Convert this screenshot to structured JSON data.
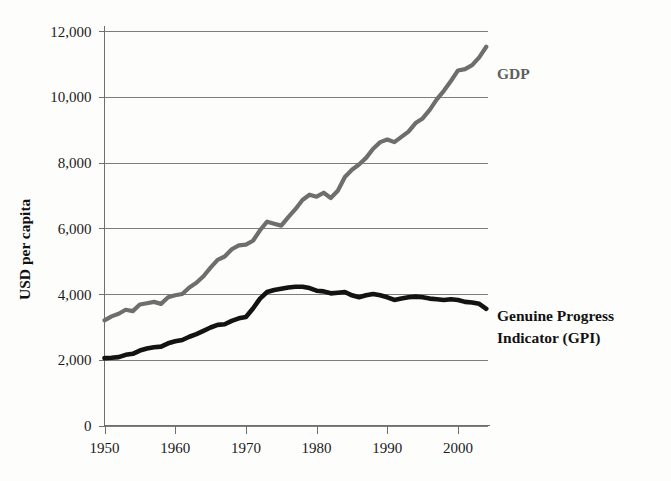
{
  "chart_data": {
    "type": "line",
    "title": "",
    "xlabel": "",
    "ylabel": "USD per capita",
    "xlim": [
      1950,
      2004
    ],
    "ylim": [
      0,
      12000
    ],
    "grid": true,
    "legend_position": "inline-right",
    "x_ticks": [
      "1950",
      "1960",
      "1970",
      "1980",
      "1990",
      "2000"
    ],
    "x_tick_values": [
      1950,
      1960,
      1970,
      1980,
      1990,
      2000
    ],
    "y_ticks": [
      "0",
      "2,000",
      "4,000",
      "6,000",
      "8,000",
      "10,000",
      "12,000"
    ],
    "y_tick_values": [
      0,
      2000,
      4000,
      6000,
      8000,
      10000,
      12000
    ],
    "x": [
      1950,
      1951,
      1952,
      1953,
      1954,
      1955,
      1956,
      1957,
      1958,
      1959,
      1960,
      1961,
      1962,
      1963,
      1964,
      1965,
      1966,
      1967,
      1968,
      1969,
      1970,
      1971,
      1972,
      1973,
      1974,
      1975,
      1976,
      1977,
      1978,
      1979,
      1980,
      1981,
      1982,
      1983,
      1984,
      1985,
      1986,
      1987,
      1988,
      1989,
      1990,
      1991,
      1992,
      1993,
      1994,
      1995,
      1996,
      1997,
      1998,
      1999,
      2000,
      2001,
      2002,
      2003,
      2004
    ],
    "series": [
      {
        "name": "GDP",
        "color": "#6e6e6e",
        "label": "GDP",
        "values": [
          3200,
          3320,
          3400,
          3520,
          3480,
          3680,
          3720,
          3760,
          3700,
          3900,
          3960,
          4000,
          4200,
          4340,
          4540,
          4800,
          5040,
          5140,
          5360,
          5480,
          5500,
          5620,
          5940,
          6200,
          6140,
          6080,
          6340,
          6580,
          6860,
          7020,
          6960,
          7080,
          6920,
          7140,
          7560,
          7780,
          7940,
          8140,
          8420,
          8620,
          8700,
          8620,
          8780,
          8940,
          9200,
          9340,
          9600,
          9920,
          10180,
          10480,
          10800,
          10840,
          10960,
          11200,
          11520
        ]
      },
      {
        "name": "Genuine Progress Indicator (GPI)",
        "color": "#131313",
        "label": "Genuine Progress Indicator (GPI)",
        "values": [
          2050,
          2060,
          2080,
          2150,
          2180,
          2280,
          2340,
          2380,
          2400,
          2500,
          2560,
          2600,
          2700,
          2780,
          2880,
          2980,
          3060,
          3080,
          3180,
          3260,
          3300,
          3560,
          3860,
          4060,
          4120,
          4160,
          4200,
          4220,
          4220,
          4180,
          4100,
          4080,
          4020,
          4040,
          4060,
          3960,
          3900,
          3960,
          4000,
          3960,
          3900,
          3820,
          3860,
          3900,
          3920,
          3900,
          3860,
          3840,
          3820,
          3840,
          3820,
          3760,
          3740,
          3700,
          3550
        ]
      }
    ],
    "annotations": [
      {
        "text": "GDP",
        "series": "GDP"
      },
      {
        "text": "Genuine Progress",
        "series": "GPI",
        "line": 1
      },
      {
        "text": "Indicator (GPI)",
        "series": "GPI",
        "line": 2
      }
    ]
  }
}
